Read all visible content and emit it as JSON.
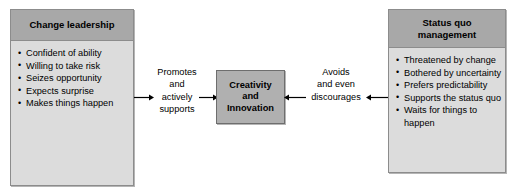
{
  "diagram": {
    "left_box": {
      "header": "Change leadership",
      "bullets": [
        "Confident of ability",
        "Willing to take risk",
        "Seizes opportunity",
        "Expects surprise",
        "Makes things happen"
      ]
    },
    "center_box": {
      "label": "Creativity and Innovation",
      "line1": "Creativity",
      "line2": "and",
      "line3": "Innovation"
    },
    "right_box": {
      "header": "Status quo management",
      "header_line1": "Status quo",
      "header_line2": "management",
      "bullets": [
        "Threatened by change",
        "Bothered by uncertainty",
        "Prefers predictability",
        "Supports the status quo",
        "Waits for things to happen"
      ]
    },
    "connectors": {
      "left_label": "Promotes\nand\nactively\nsupports",
      "right_label": "Avoids\nand even\ndiscourages",
      "left_arrow_from_box": "arrow-right",
      "left_arrow_to_center": "arrow-right",
      "right_arrow_from_center": "arrow-left",
      "right_arrow_to_center": "arrow-left"
    }
  },
  "colors": {
    "header_fill": "#a8a8a8",
    "body_fill": "#dcdcdc",
    "center_fill": "#b0b0b0",
    "border": "#8c8c8c",
    "center_border": "#6e6e6e",
    "text": "#000000",
    "background": "#ffffff"
  }
}
